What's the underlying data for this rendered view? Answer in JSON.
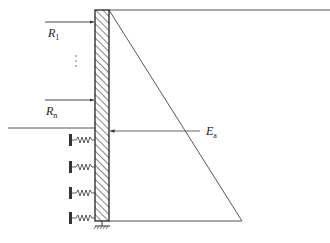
{
  "diagram": {
    "type": "retaining-wall-earth-pressure",
    "labels": {
      "r1": {
        "main": "R",
        "sub": "1"
      },
      "rn": {
        "main": "R",
        "sub": "n"
      },
      "ea": {
        "main": "E",
        "sub": "a"
      },
      "ellipsis": "⋮"
    },
    "colors": {
      "line": "#333333",
      "hatch": "#333333",
      "background": "#ffffff"
    },
    "elements": {
      "wall": {
        "x": 95,
        "y": 10,
        "width": 14,
        "height": 211,
        "hatched": true
      },
      "pressure_triangle": {
        "top": [
          109,
          10
        ],
        "bottom_right": [
          242,
          221
        ],
        "bottom_left": [
          109,
          221
        ]
      },
      "top_line": {
        "from": [
          109,
          10
        ],
        "to": [
          330,
          10
        ]
      },
      "ground_line": {
        "from": [
          8,
          128
        ],
        "to": [
          95,
          128
        ]
      },
      "loads": [
        {
          "label": "R1",
          "y": 22,
          "from_x": 45,
          "to_x": 95
        },
        {
          "label": "Rn",
          "y": 100,
          "from_x": 45,
          "to_x": 95
        }
      ],
      "resultant": {
        "label": "Ea",
        "y": 131,
        "from_x": 200,
        "to_x": 109
      },
      "springs": [
        {
          "y": 140
        },
        {
          "y": 167
        },
        {
          "y": 193
        },
        {
          "y": 218
        }
      ],
      "base_support": {
        "x": 102,
        "y": 221
      }
    }
  }
}
